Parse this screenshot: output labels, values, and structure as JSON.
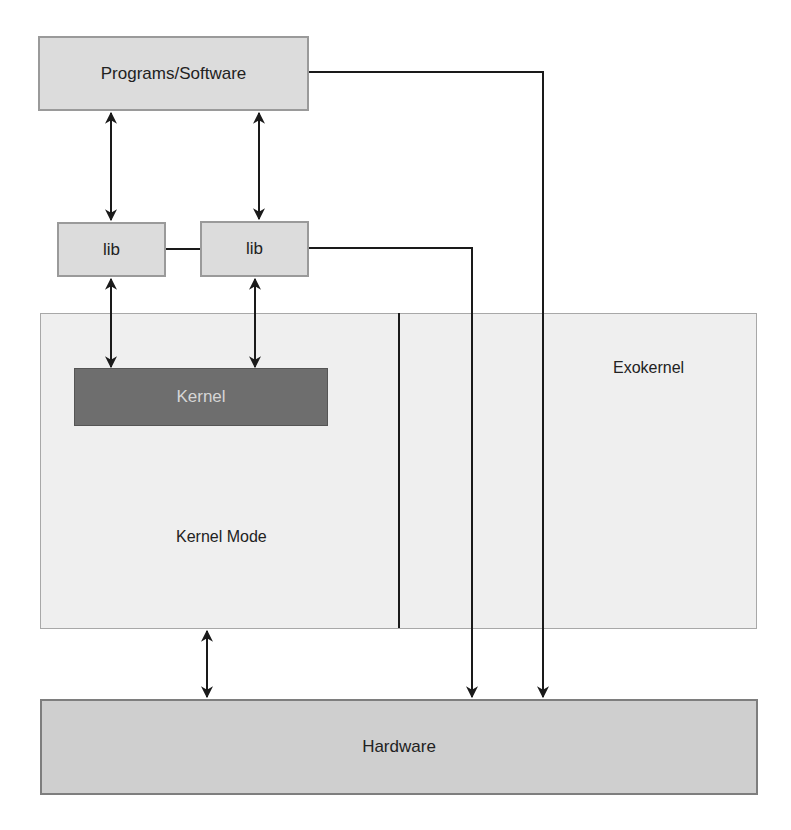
{
  "diagram": {
    "title": "",
    "nodes": {
      "programs": {
        "label": "Programs/Software"
      },
      "lib1": {
        "label": "lib"
      },
      "lib2": {
        "label": "lib"
      },
      "kernel_mode": {
        "label": "Kernel Mode"
      },
      "kernel": {
        "label": "Kernel"
      },
      "exokernel": {
        "label": "Exokernel"
      },
      "hardware": {
        "label": "Hardware"
      }
    },
    "edges": [
      {
        "from": "programs",
        "to": "lib1",
        "type": "bidirectional"
      },
      {
        "from": "programs",
        "to": "lib2",
        "type": "bidirectional"
      },
      {
        "from": "lib1",
        "to": "lib2",
        "type": "line"
      },
      {
        "from": "lib1",
        "to": "kernel",
        "type": "bidirectional"
      },
      {
        "from": "lib2",
        "to": "kernel",
        "type": "bidirectional"
      },
      {
        "from": "lib2",
        "to": "hardware",
        "type": "directed"
      },
      {
        "from": "programs",
        "to": "hardware",
        "type": "directed"
      },
      {
        "from": "kernel_mode",
        "to": "hardware",
        "type": "bidirectional"
      }
    ],
    "colors": {
      "light_box": "#dcdcdc",
      "container": "#efefef",
      "kernel_box": "#6e6e6e",
      "hardware_box": "#cfcfcf",
      "line": "#1a1a1a"
    }
  }
}
